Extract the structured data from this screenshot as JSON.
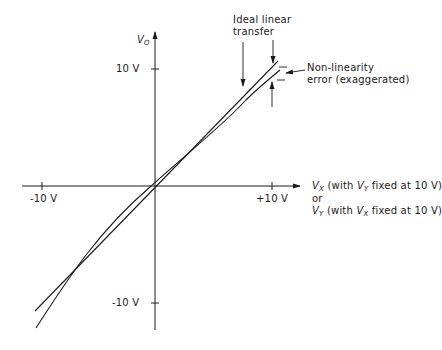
{
  "diagram": {
    "y_axis": {
      "label_main": "V",
      "label_sub": "O",
      "ticks": {
        "pos": "10 V",
        "neg": "-10 V"
      }
    },
    "x_axis": {
      "ticks": {
        "pos": "+10 V",
        "neg": "-10 V"
      },
      "label_line1_var": "V",
      "label_line1_sub": "X",
      "label_line1_text_a": " (with ",
      "label_line1_inner_var": "V",
      "label_line1_inner_sub": "Y",
      "label_line1_text_b": " fixed at 10 V)",
      "label_or": "or",
      "label_line2_var": "V",
      "label_line2_sub": "Y",
      "label_line2_text_a": " (with ",
      "label_line2_inner_var": "V",
      "label_line2_inner_sub": "X",
      "label_line2_text_b": " fixed at 10 V)"
    },
    "annotations": {
      "ideal_line1": "Ideal linear",
      "ideal_line2": "transfer",
      "error_line1": "Non-linearity",
      "error_line2": "error (exaggerated)"
    },
    "curves": [
      {
        "name": "ideal linear transfer",
        "type": "straight line"
      },
      {
        "name": "actual transfer with non-linearity",
        "type": "curve"
      }
    ],
    "colors": {
      "ink": "#1a1a1a",
      "background": "#ffffff"
    }
  }
}
